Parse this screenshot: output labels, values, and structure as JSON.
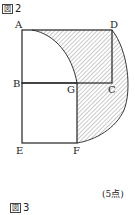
{
  "figure2": {
    "title_box": "図",
    "title_num": "2",
    "labels": {
      "A": "A",
      "B": "B",
      "C": "C",
      "D": "D",
      "E": "E",
      "F": "F",
      "G": "G"
    },
    "points_note": "(5点)"
  },
  "figure3": {
    "title_box": "図",
    "title_num": "3"
  },
  "colors": {
    "line": "#222222",
    "hatch": "#555555"
  }
}
